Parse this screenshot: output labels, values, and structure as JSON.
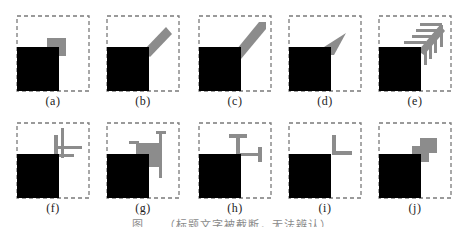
{
  "figure": {
    "colors": {
      "background": "#ffffff",
      "border_dash": "#7a7a7a",
      "block": "#000000",
      "shape": "#8c8c8c"
    },
    "panels": [
      {
        "id": "a",
        "label": "(a)",
        "shape": "square offset at top-right corner of block"
      },
      {
        "id": "b",
        "label": "(b)",
        "shape": "short diagonal bar from block corner"
      },
      {
        "id": "c",
        "label": "(c)",
        "shape": "long thick diagonal bar from block corner"
      },
      {
        "id": "d",
        "label": "(d)",
        "shape": "tapered diagonal wedge from block corner"
      },
      {
        "id": "e",
        "label": "(e)",
        "shape": "diagonal bar with comb-like side teeth"
      },
      {
        "id": "f",
        "label": "(f)",
        "shape": "crossed horizontal and vertical bars at block corner"
      },
      {
        "id": "g",
        "label": "(g)",
        "shape": "square with extended T-capped arms"
      },
      {
        "id": "h",
        "label": "(h)",
        "shape": "two T-shaped bars from block corner"
      },
      {
        "id": "i",
        "label": "(i)",
        "shape": "L-shaped bar at block corner"
      },
      {
        "id": "j",
        "label": "(j)",
        "shape": "two stacked offset squares at block corner"
      }
    ],
    "caption": "图 … （标题文字被截断，无法辨认）"
  }
}
